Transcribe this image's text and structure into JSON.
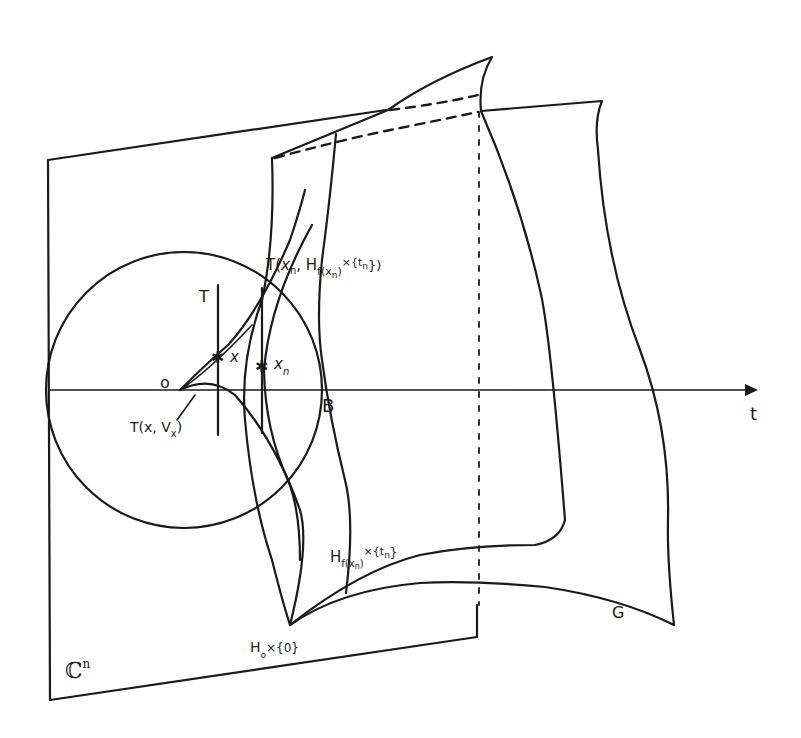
{
  "diagram": {
    "colors": {
      "ink": "#1a1a1a",
      "paper": "#ffffff"
    },
    "labels": {
      "plane": "ℂ",
      "plane_sup": "n",
      "origin": "o",
      "ball": "B",
      "axis": "t",
      "tangent_left": "T",
      "tangent_right_main": "T(",
      "tangent_right_x": "x",
      "tangent_right_sub": "n",
      "tangent_right_mid": ", H",
      "tangent_right_f": "f(x",
      "tangent_right_fsub": "n",
      "tangent_right_close": ")",
      "tangent_right_tail": "×{t",
      "tangent_right_tailsub": "n",
      "tangent_right_end": "})",
      "point_x": "x",
      "point_xn": "x",
      "point_xn_sub": "n",
      "tangent_vx_prefix": "T(x, V",
      "tangent_vx_sub": "x",
      "tangent_vx_suffix": ")",
      "surface_h_n_main": "H",
      "surface_h_n_sub": "f(x",
      "surface_h_n_subsub": "n",
      "surface_h_n_close": ")",
      "surface_h_n_tail": "×{t",
      "surface_h_n_tailsub": "n",
      "surface_h_n_end": "}",
      "surface_h0_main": "H",
      "surface_h0_sub": "o",
      "surface_h0_tail": "×{0}",
      "surface_g": "G"
    }
  }
}
